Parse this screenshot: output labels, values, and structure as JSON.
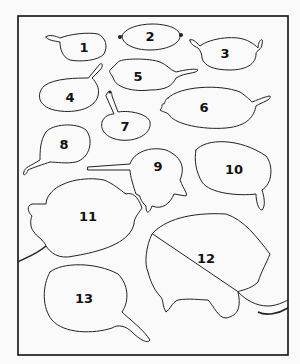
{
  "diagram": {
    "title": "",
    "labels": [
      "1",
      "2",
      "3",
      "4",
      "5",
      "6",
      "7",
      "8",
      "9",
      "10",
      "11",
      "12",
      "13"
    ],
    "colors": {
      "line": "#222222",
      "background": "#fafafa"
    }
  }
}
